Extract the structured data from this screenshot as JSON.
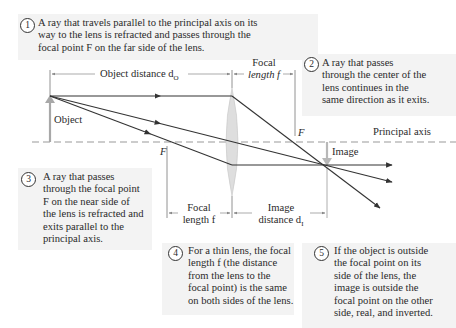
{
  "callouts": [
    {
      "num": "1",
      "lines": [
        "A ray that travels parallel to the principal axis on its",
        "way to the lens is refracted and passes through the",
        "focal point F on the far side of the lens."
      ]
    },
    {
      "num": "2",
      "lines": [
        "A ray that passes",
        "through the center of the",
        "lens continues in the",
        "same direction as it exits."
      ]
    },
    {
      "num": "3",
      "lines": [
        "A ray that passes",
        "through the focal point",
        "F on the near side of",
        "the lens is refracted and",
        "exits parallel to the",
        "principal axis."
      ]
    },
    {
      "num": "4",
      "lines": [
        "For a thin lens, the focal",
        "length f (the distance",
        "from the lens to the",
        "focal point) is the same",
        "on both sides of the lens."
      ]
    },
    {
      "num": "5",
      "lines": [
        "If the object is outside",
        "the focal point on its",
        "side of the lens, the",
        "image is outside the",
        "focal point on the other",
        "side, real, and inverted."
      ]
    }
  ],
  "labels": {
    "object_distance": "Object distance d",
    "object_distance_sub": "O",
    "focal_top_1": "Focal",
    "focal_top_2": "length f",
    "object": "Object",
    "image": "Image",
    "principal_axis": "Principal axis",
    "f_near": "F",
    "f_far": "F",
    "focal_bottom_1": "Focal",
    "focal_bottom_2": "length f",
    "image_distance_1": "Image",
    "image_distance_2": "distance d",
    "image_distance_sub": "I"
  },
  "colors": {
    "callout_bg": "#f3f3f3",
    "ray": "#333333",
    "axis": "#999999",
    "lens": "#d8d8d8",
    "arrow_gray": "#aaaaaa"
  }
}
